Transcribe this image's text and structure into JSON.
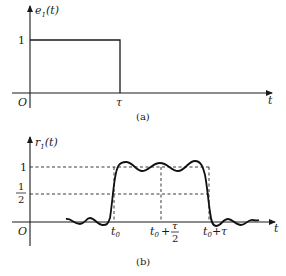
{
  "panel_a": {
    "y_label": "e",
    "y_label_sub": "1",
    "y_label_arg": "(t)",
    "x_label": "t",
    "origin": "O",
    "level_one": "1",
    "tau": "τ",
    "caption": "(a)"
  },
  "panel_b": {
    "y_label": "r",
    "y_label_sub": "1",
    "y_label_arg": "(t)",
    "x_label": "t",
    "origin": "O",
    "level_one": "1",
    "half_num": "1",
    "half_den": "2",
    "t0_main": "t",
    "t0_sub": "0",
    "mid_prefix": "t",
    "mid_sub": "0",
    "mid_plus": "+",
    "mid_frac_num": "τ",
    "mid_frac_den": "2",
    "end_main": "t",
    "end_sub": "0",
    "end_rest": "+τ",
    "caption": "(b)"
  },
  "colors": {
    "ink": "#1a1a1a",
    "background": "#ffffff"
  }
}
